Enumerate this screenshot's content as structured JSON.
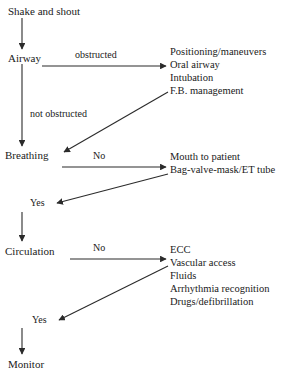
{
  "diagram": {
    "stroke_color": "#2b2b2b",
    "text_color": "#1a1a1a",
    "background_color": "#ffffff"
  },
  "nodes": {
    "start": {
      "label": "Shake and shout"
    },
    "airway": {
      "label": "Airway"
    },
    "breathing": {
      "label": "Breathing"
    },
    "circulation": {
      "label": "Circulation"
    },
    "monitor": {
      "label": "Monitor"
    }
  },
  "edge_labels": {
    "obstructed": "obstructed",
    "not_obstructed": "not obstructed",
    "breathing_no": "No",
    "breathing_yes": "Yes",
    "circulation_no": "No",
    "circulation_yes": "Yes"
  },
  "actions": {
    "airway": [
      "Positioning/maneuvers",
      "Oral airway",
      "Intubation",
      "F.B.  management"
    ],
    "breathing": [
      "Mouth to patient",
      "Bag-valve-mask/ET tube"
    ],
    "circulation": [
      "ECC",
      "Vascular access",
      "Fluids",
      "Arrhythmia recognition",
      "Drugs/defibrillation"
    ]
  }
}
